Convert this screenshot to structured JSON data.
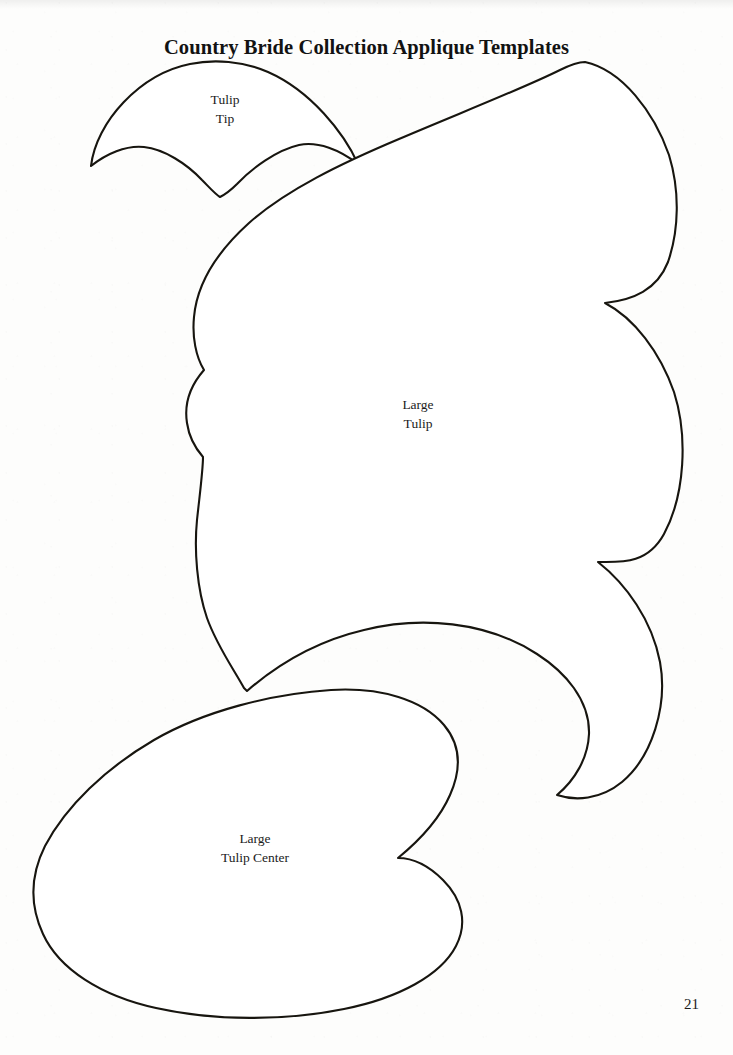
{
  "page": {
    "title": "Country Bride Collection Applique Templates",
    "page_number": "21",
    "background_color": "#fdfdfc",
    "ink_color": "#17150f"
  },
  "shapes": [
    {
      "id": "tulip-tip",
      "label": "Tulip\nTip",
      "label_lines": [
        "Tulip",
        "Tip"
      ],
      "kind": "applique-template-outline"
    },
    {
      "id": "large-tulip",
      "label": "Large\nTulip",
      "label_lines": [
        "Large",
        "Tulip"
      ],
      "kind": "applique-template-outline"
    },
    {
      "id": "large-tulip-center",
      "label": "Large\nTulip Center",
      "label_lines": [
        "Large",
        "Tulip Center"
      ],
      "kind": "applique-template-outline"
    }
  ]
}
